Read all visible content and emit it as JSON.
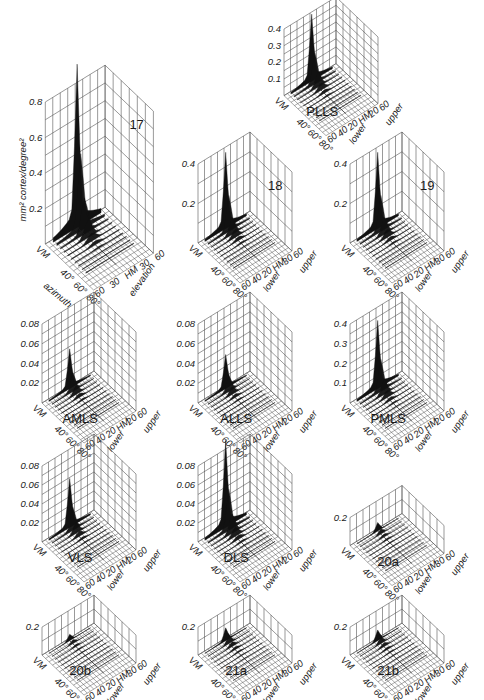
{
  "figure": {
    "y_axis_label": "mm² cortex/degree²",
    "azimuth_label": "azimuth",
    "elevation_label": "elevation",
    "colors": {
      "ink": "#1a1a1a",
      "grid": "#555555",
      "background": "#ffffff"
    }
  },
  "chart_data": [
    {
      "type": "surface3d",
      "title": "17",
      "ylabel": "mm² cortex/degree²",
      "xlabel": "azimuth",
      "zlabel": "elevation",
      "z_ticks": [
        "0.2",
        "0.4",
        "0.6",
        "0.8"
      ],
      "zlim": [
        0,
        0.8
      ],
      "azimuth_ticks": [
        "VM",
        "40°",
        "60°",
        "80°"
      ],
      "elevation_ticks": [
        "60",
        "30",
        "HM",
        "30",
        "60"
      ],
      "peak": 0.8
    },
    {
      "type": "surface3d",
      "title": "PLLS",
      "z_ticks": [
        "0.1",
        "0.2",
        "0.3",
        "0.4"
      ],
      "zlim": [
        0,
        0.4
      ],
      "azimuth_ticks": [
        "VM",
        "40°",
        "60°",
        "80°"
      ],
      "elevation_ticks": [
        "60",
        "20",
        "HM",
        "20",
        "40",
        "60"
      ],
      "elevation_side": [
        "upper",
        "lower"
      ],
      "peak": 0.35
    },
    {
      "type": "surface3d",
      "title": "18",
      "z_ticks": [
        "0.2",
        "0.4"
      ],
      "zlim": [
        0,
        0.5
      ],
      "azimuth_ticks": [
        "VM",
        "40°",
        "60°",
        "80°"
      ],
      "elevation_ticks": [
        "60",
        "30",
        "HM",
        "20",
        "40",
        "60"
      ],
      "elevation_side": [
        "upper",
        "lower"
      ],
      "peak": 0.42
    },
    {
      "type": "surface3d",
      "title": "19",
      "z_ticks": [
        "0.2",
        "0.4"
      ],
      "zlim": [
        0,
        0.5
      ],
      "azimuth_ticks": [
        "VM",
        "40°",
        "60°",
        "80°"
      ],
      "elevation_ticks": [
        "60",
        "30",
        "HM",
        "20",
        "40",
        "60"
      ],
      "elevation_side": [
        "upper",
        "lower"
      ],
      "peak": 0.42
    },
    {
      "type": "surface3d",
      "title": "AMLS",
      "z_ticks": [
        "0.02",
        "0.04",
        "0.06",
        "0.08"
      ],
      "zlim": [
        0,
        0.08
      ],
      "azimuth_ticks": [
        "VM",
        "40°",
        "60°",
        "80°"
      ],
      "elevation_ticks": [
        "60",
        "20",
        "HM",
        "20",
        "40",
        "60"
      ],
      "elevation_side": [
        "upper",
        "lower"
      ],
      "peak": 0.035
    },
    {
      "type": "surface3d",
      "title": "ALLS",
      "z_ticks": [
        "0.02",
        "0.04",
        "0.06",
        "0.08"
      ],
      "zlim": [
        0,
        0.08
      ],
      "azimuth_ticks": [
        "VM",
        "40°",
        "60°",
        "80°"
      ],
      "elevation_ticks": [
        "60",
        "20",
        "HM",
        "20",
        "40",
        "60"
      ],
      "elevation_side": [
        "upper",
        "lower"
      ],
      "peak": 0.03
    },
    {
      "type": "surface3d",
      "title": "PMLS",
      "z_ticks": [
        "0.1",
        "0.2",
        "0.3",
        "0.4"
      ],
      "zlim": [
        0,
        0.4
      ],
      "azimuth_ticks": [
        "VM",
        "40°",
        "60°",
        "80°"
      ],
      "elevation_ticks": [
        "60",
        "20",
        "HM",
        "20",
        "40",
        "60"
      ],
      "elevation_side": [
        "upper",
        "lower"
      ],
      "peak": 0.3
    },
    {
      "type": "surface3d",
      "title": "VLS",
      "z_ticks": [
        "0.02",
        "0.04",
        "0.06",
        "0.08"
      ],
      "zlim": [
        0,
        0.08
      ],
      "azimuth_ticks": [
        "VM",
        "40°",
        "60°",
        "80°"
      ],
      "elevation_ticks": [
        "60",
        "20",
        "HM",
        "20",
        "40",
        "60"
      ],
      "elevation_side": [
        "upper",
        "lower"
      ],
      "peak": 0.045
    },
    {
      "type": "surface3d",
      "title": "DLS",
      "z_ticks": [
        "0.02",
        "0.04",
        "0.06",
        "0.08"
      ],
      "zlim": [
        0,
        0.08
      ],
      "azimuth_ticks": [
        "VM",
        "40°",
        "60°",
        "80°"
      ],
      "elevation_ticks": [
        "60",
        "20",
        "HM",
        "20",
        "40",
        "60"
      ],
      "elevation_side": [
        "upper",
        "lower"
      ],
      "peak": 0.08
    },
    {
      "type": "surface3d",
      "title": "20a",
      "z_ticks": [
        "0.2"
      ],
      "zlim": [
        0,
        0.3
      ],
      "azimuth_ticks": [
        "VM",
        "40°",
        "60°",
        "80°"
      ],
      "elevation_ticks": [
        "60",
        "30",
        "HM",
        "20",
        "40",
        "60"
      ],
      "elevation_side": [
        "upper",
        "lower"
      ],
      "peak": 0.08
    },
    {
      "type": "surface3d",
      "title": "20b",
      "z_ticks": [
        "0.2"
      ],
      "zlim": [
        0,
        0.3
      ],
      "azimuth_ticks": [
        "VM",
        "40°",
        "60°",
        "80°"
      ],
      "elevation_ticks": [
        "60",
        "30",
        "HM",
        "20",
        "40",
        "60"
      ],
      "elevation_side": [
        "upper",
        "lower"
      ],
      "peak": 0.06
    },
    {
      "type": "surface3d",
      "title": "21a",
      "z_ticks": [
        "0.2"
      ],
      "zlim": [
        0,
        0.3
      ],
      "azimuth_ticks": [
        "VM",
        "40°",
        "60°",
        "80°"
      ],
      "elevation_ticks": [
        "60",
        "30",
        "HM",
        "20",
        "40",
        "60"
      ],
      "elevation_side": [
        "upper",
        "lower"
      ],
      "peak": 0.12
    },
    {
      "type": "surface3d",
      "title": "21b",
      "z_ticks": [
        "0.2"
      ],
      "zlim": [
        0,
        0.3
      ],
      "azimuth_ticks": [
        "VM",
        "40°",
        "60°",
        "80°"
      ],
      "elevation_ticks": [
        "60",
        "30",
        "HM",
        "20",
        "40",
        "60"
      ],
      "elevation_side": [
        "upper",
        "lower"
      ],
      "peak": 0.1
    }
  ],
  "panels": [
    {
      "id": "p17",
      "x": 20,
      "y": 92,
      "w": 170,
      "h": 190,
      "zmax": 0.8,
      "peak": 0.8,
      "ticks": [
        "0.2",
        "0.4",
        "0.6",
        "0.8"
      ],
      "label": "17",
      "labelPos": "corner",
      "elev": [
        "60",
        "30",
        "HM",
        "30",
        "60"
      ],
      "big": true
    },
    {
      "id": "pPLLS",
      "x": 262,
      "y": 15,
      "w": 130,
      "h": 130,
      "zmax": 0.4,
      "peak": 0.35,
      "ticks": [
        "0.1",
        "0.2",
        "0.3",
        "0.4"
      ],
      "label": "PLLS",
      "labelPos": "floor",
      "elev": [
        "60",
        "20",
        "HM",
        "20",
        "40",
        "60"
      ]
    },
    {
      "id": "p18",
      "x": 176,
      "y": 150,
      "w": 140,
      "h": 150,
      "zmax": 0.5,
      "peak": 0.42,
      "ticks": [
        "0.2",
        "0.4"
      ],
      "label": "18",
      "labelPos": "corner",
      "elev": [
        "60",
        "30",
        "HM",
        "20",
        "40",
        "60"
      ]
    },
    {
      "id": "p19",
      "x": 328,
      "y": 150,
      "w": 140,
      "h": 150,
      "zmax": 0.5,
      "peak": 0.42,
      "ticks": [
        "0.2",
        "0.4"
      ],
      "label": "19",
      "labelPos": "corner",
      "elev": [
        "60",
        "30",
        "HM",
        "20",
        "40",
        "60"
      ]
    },
    {
      "id": "pAMLS",
      "x": 20,
      "y": 310,
      "w": 140,
      "h": 150,
      "zmax": 0.08,
      "peak": 0.035,
      "ticks": [
        "0.02",
        "0.04",
        "0.06",
        "0.08"
      ],
      "label": "AMLS",
      "labelPos": "floor",
      "elev": [
        "60",
        "20",
        "HM",
        "20",
        "40",
        "60"
      ]
    },
    {
      "id": "pALLS",
      "x": 176,
      "y": 310,
      "w": 140,
      "h": 150,
      "zmax": 0.08,
      "peak": 0.03,
      "ticks": [
        "0.02",
        "0.04",
        "0.06",
        "0.08"
      ],
      "label": "ALLS",
      "labelPos": "floor",
      "elev": [
        "60",
        "20",
        "HM",
        "20",
        "40",
        "60"
      ]
    },
    {
      "id": "pPMLS",
      "x": 328,
      "y": 310,
      "w": 140,
      "h": 150,
      "zmax": 0.4,
      "peak": 0.3,
      "ticks": [
        "0.1",
        "0.2",
        "0.3",
        "0.4"
      ],
      "label": "PMLS",
      "labelPos": "floor",
      "elev": [
        "60",
        "20",
        "HM",
        "20",
        "40",
        "60"
      ]
    },
    {
      "id": "pVLS",
      "x": 20,
      "y": 452,
      "w": 140,
      "h": 145,
      "zmax": 0.08,
      "peak": 0.045,
      "ticks": [
        "0.02",
        "0.04",
        "0.06",
        "0.08"
      ],
      "label": "VLS",
      "labelPos": "floor",
      "elev": [
        "60",
        "20",
        "HM",
        "20",
        "40",
        "60"
      ]
    },
    {
      "id": "pDLS",
      "x": 176,
      "y": 452,
      "w": 140,
      "h": 145,
      "zmax": 0.08,
      "peak": 0.08,
      "ticks": [
        "0.02",
        "0.04",
        "0.06",
        "0.08"
      ],
      "label": "DLS",
      "labelPos": "floor",
      "elev": [
        "60",
        "20",
        "HM",
        "20",
        "40",
        "60"
      ]
    },
    {
      "id": "p20a",
      "x": 328,
      "y": 468,
      "w": 140,
      "h": 125,
      "zmax": 0.3,
      "peak": 0.08,
      "ticks": [
        "0.2"
      ],
      "label": "20a",
      "labelPos": "floor",
      "elev": [
        "60",
        "30",
        "HM",
        "20",
        "40",
        "60"
      ],
      "flat": true
    },
    {
      "id": "p20b",
      "x": 20,
      "y": 590,
      "w": 140,
      "h": 105,
      "zmax": 0.3,
      "peak": 0.06,
      "ticks": [
        "0.2"
      ],
      "label": "20b",
      "labelPos": "floor",
      "elev": [
        "60",
        "30",
        "HM",
        "20",
        "40",
        "60"
      ],
      "flat": true
    },
    {
      "id": "p21a",
      "x": 176,
      "y": 590,
      "w": 140,
      "h": 105,
      "zmax": 0.3,
      "peak": 0.12,
      "ticks": [
        "0.2"
      ],
      "label": "21a",
      "labelPos": "floor",
      "elev": [
        "60",
        "30",
        "HM",
        "20",
        "40",
        "60"
      ],
      "flat": true
    },
    {
      "id": "p21b",
      "x": 328,
      "y": 590,
      "w": 140,
      "h": 105,
      "zmax": 0.3,
      "peak": 0.1,
      "ticks": [
        "0.2"
      ],
      "label": "21b",
      "labelPos": "floor",
      "elev": [
        "60",
        "30",
        "HM",
        "20",
        "40",
        "60"
      ],
      "flat": true
    }
  ],
  "axis_text": {
    "vm": "VM",
    "az": [
      "40°",
      "60°",
      "80°"
    ],
    "upper": "upper",
    "lower": "lower"
  }
}
